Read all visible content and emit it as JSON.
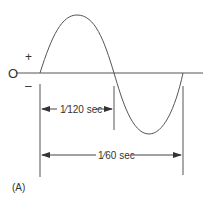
{
  "diagram": {
    "axis_zero_label": "O",
    "positive_label": "+",
    "negative_label": "–",
    "half_cycle_label": "1⁄120 sec",
    "full_cycle_label": "1⁄60 sec",
    "panel_label": "(A)",
    "colors": {
      "line": "#444444",
      "text": "#333333",
      "background": "#ffffff"
    }
  }
}
